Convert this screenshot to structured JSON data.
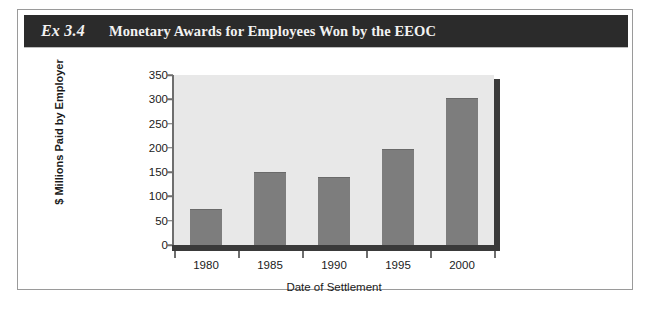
{
  "figure": {
    "exhibit_number": "Ex 3.4",
    "title": "Monetary Awards for Employees Won by the EEOC",
    "title_bar_color": "#2b2b2b",
    "title_text_color": "#f2f2f2",
    "border_color": "#9a9a9a"
  },
  "chart_data": {
    "type": "bar",
    "title": "Monetary Awards for Employees Won by the EEOC",
    "categories": [
      "1980",
      "1985",
      "1990",
      "1995",
      "2000"
    ],
    "values": [
      75,
      150,
      140,
      198,
      303
    ],
    "xlabel": "Date of Settlement",
    "ylabel": "$ Millions Paid by Employer",
    "ylim": [
      0,
      350
    ],
    "yticks": [
      0,
      50,
      100,
      150,
      200,
      250,
      300,
      350
    ],
    "ytick_labels": [
      "0",
      "50",
      "100",
      "150",
      "200",
      "250",
      "300",
      "350"
    ],
    "grid": false,
    "legend": false,
    "bar_color": "#7d7d7d",
    "plot_background": "#e8e8e8",
    "axis_color": "#3a3a3a"
  }
}
